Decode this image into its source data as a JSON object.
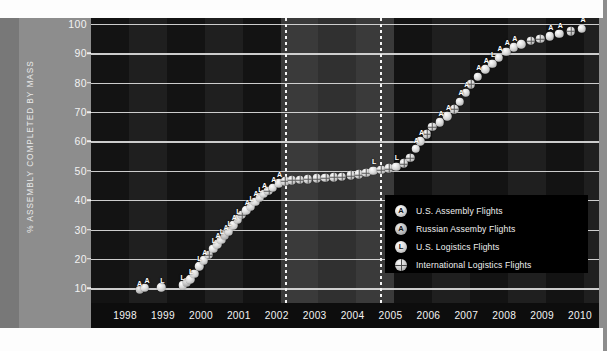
{
  "chart_data": {
    "type": "scatter",
    "title": "",
    "xlabel": "",
    "ylabel": "% ASSEMBLY COMPLETED BY MASS",
    "xlim": [
      1997.6,
      2011.0
    ],
    "ylim": [
      5,
      102
    ],
    "grid": true,
    "legend_position": "inside-right",
    "x_tick_labels": [
      "1998",
      "1999",
      "2000",
      "2001",
      "2002",
      "2003",
      "2004",
      "2005",
      "2006",
      "2007",
      "2008",
      "2009",
      "2010"
    ],
    "y_tick_labels": [
      "10",
      "20",
      "30",
      "40",
      "50",
      "60",
      "70",
      "80",
      "90",
      "100"
    ],
    "y_tick_values": [
      10,
      20,
      30,
      40,
      50,
      60,
      70,
      80,
      90,
      100
    ],
    "annotations": [
      {
        "name": "shuttle-standdown-start",
        "x": 2002.72
      },
      {
        "name": "shuttle-standdown-end",
        "x": 2005.22
      }
    ],
    "legend": [
      {
        "key": "us-assembly",
        "glyph": "A",
        "label": "U.S. Assembly Flights"
      },
      {
        "key": "russian-assembly",
        "glyph": "A",
        "label": "Russian Assemby Flights"
      },
      {
        "key": "us-logistics",
        "glyph": "L",
        "label": "U.S. Logistics Flights"
      },
      {
        "key": "international-logistics",
        "glyph": "",
        "label": "International Logistics Flights"
      }
    ],
    "points": [
      {
        "x": 1998.88,
        "y": 9.5,
        "t": "russian-assembly",
        "flag": "A"
      },
      {
        "x": 1999.02,
        "y": 10.2,
        "t": "us-assembly",
        "flag": "A"
      },
      {
        "x": 1999.45,
        "y": 10.4,
        "t": "us-logistics",
        "flag": "L"
      },
      {
        "x": 2000.02,
        "y": 11.0,
        "t": "us-logistics",
        "flag": "L"
      },
      {
        "x": 2000.12,
        "y": 12.0,
        "t": "russian-assembly",
        "flag": "A"
      },
      {
        "x": 2000.22,
        "y": 13.0,
        "t": "us-logistics",
        "flag": "L"
      },
      {
        "x": 2000.33,
        "y": 15.0,
        "t": "us-assembly",
        "flag": "A"
      },
      {
        "x": 2000.45,
        "y": 17.5,
        "t": "us-logistics",
        "flag": "L"
      },
      {
        "x": 2000.58,
        "y": 19.5,
        "t": "us-assembly",
        "flag": "A"
      },
      {
        "x": 2000.7,
        "y": 21.5,
        "t": "international-logistics",
        "flag": ""
      },
      {
        "x": 2000.82,
        "y": 23.5,
        "t": "us-logistics",
        "flag": "L"
      },
      {
        "x": 2000.93,
        "y": 25.0,
        "t": "us-assembly",
        "flag": "A"
      },
      {
        "x": 2001.03,
        "y": 26.5,
        "t": "us-logistics",
        "flag": "L"
      },
      {
        "x": 2001.13,
        "y": 28.0,
        "t": "russian-assembly",
        "flag": "A"
      },
      {
        "x": 2001.24,
        "y": 29.5,
        "t": "us-logistics",
        "flag": "L"
      },
      {
        "x": 2001.35,
        "y": 31.5,
        "t": "us-assembly",
        "flag": "A"
      },
      {
        "x": 2001.47,
        "y": 33.5,
        "t": "us-logistics",
        "flag": "L"
      },
      {
        "x": 2001.58,
        "y": 35.0,
        "t": "international-logistics",
        "flag": ""
      },
      {
        "x": 2001.7,
        "y": 36.5,
        "t": "us-assembly",
        "flag": "A"
      },
      {
        "x": 2001.82,
        "y": 38.0,
        "t": "us-logistics",
        "flag": "L"
      },
      {
        "x": 2001.93,
        "y": 39.5,
        "t": "us-assembly",
        "flag": "A"
      },
      {
        "x": 2002.05,
        "y": 41.0,
        "t": "us-logistics",
        "flag": "L"
      },
      {
        "x": 2002.16,
        "y": 42.2,
        "t": "us-assembly",
        "flag": "A"
      },
      {
        "x": 2002.28,
        "y": 43.2,
        "t": "international-logistics",
        "flag": ""
      },
      {
        "x": 2002.4,
        "y": 44.2,
        "t": "us-assembly",
        "flag": "A"
      },
      {
        "x": 2002.55,
        "y": 45.8,
        "t": "us-assembly",
        "flag": "A"
      },
      {
        "x": 2002.72,
        "y": 46.5,
        "t": "international-logistics",
        "flag": ""
      },
      {
        "x": 2002.9,
        "y": 46.8,
        "t": "international-logistics",
        "flag": ""
      },
      {
        "x": 2003.1,
        "y": 47.0,
        "t": "international-logistics",
        "flag": ""
      },
      {
        "x": 2003.32,
        "y": 47.2,
        "t": "international-logistics",
        "flag": ""
      },
      {
        "x": 2003.55,
        "y": 47.4,
        "t": "international-logistics",
        "flag": ""
      },
      {
        "x": 2003.78,
        "y": 47.6,
        "t": "international-logistics",
        "flag": ""
      },
      {
        "x": 2004.0,
        "y": 47.8,
        "t": "international-logistics",
        "flag": ""
      },
      {
        "x": 2004.22,
        "y": 48.0,
        "t": "international-logistics",
        "flag": ""
      },
      {
        "x": 2004.45,
        "y": 48.4,
        "t": "international-logistics",
        "flag": ""
      },
      {
        "x": 2004.66,
        "y": 48.8,
        "t": "international-logistics",
        "flag": ""
      },
      {
        "x": 2004.86,
        "y": 49.4,
        "t": "international-logistics",
        "flag": ""
      },
      {
        "x": 2005.05,
        "y": 50.0,
        "t": "us-logistics",
        "flag": "L"
      },
      {
        "x": 2005.25,
        "y": 50.4,
        "t": "international-logistics",
        "flag": ""
      },
      {
        "x": 2005.45,
        "y": 50.8,
        "t": "international-logistics",
        "flag": ""
      },
      {
        "x": 2005.65,
        "y": 51.4,
        "t": "us-logistics",
        "flag": "L"
      },
      {
        "x": 2005.85,
        "y": 52.5,
        "t": "international-logistics",
        "flag": ""
      },
      {
        "x": 2006.02,
        "y": 54.5,
        "t": "international-logistics",
        "flag": ""
      },
      {
        "x": 2006.16,
        "y": 57.5,
        "t": "us-assembly",
        "flag": "A"
      },
      {
        "x": 2006.28,
        "y": 60.0,
        "t": "us-assembly",
        "flag": "A"
      },
      {
        "x": 2006.45,
        "y": 62.5,
        "t": "international-logistics",
        "flag": ""
      },
      {
        "x": 2006.6,
        "y": 65.0,
        "t": "international-logistics",
        "flag": ""
      },
      {
        "x": 2006.8,
        "y": 66.5,
        "t": "us-assembly",
        "flag": "A"
      },
      {
        "x": 2007.0,
        "y": 68.5,
        "t": "us-assembly",
        "flag": "A"
      },
      {
        "x": 2007.18,
        "y": 71.0,
        "t": "international-logistics",
        "flag": ""
      },
      {
        "x": 2007.33,
        "y": 73.5,
        "t": "us-assembly",
        "flag": "A"
      },
      {
        "x": 2007.48,
        "y": 76.5,
        "t": "us-assembly",
        "flag": "A"
      },
      {
        "x": 2007.62,
        "y": 79.5,
        "t": "international-logistics",
        "flag": ""
      },
      {
        "x": 2007.8,
        "y": 82.0,
        "t": "us-assembly",
        "flag": "A"
      },
      {
        "x": 2008.0,
        "y": 84.5,
        "t": "us-assembly",
        "flag": "A"
      },
      {
        "x": 2008.18,
        "y": 86.5,
        "t": "us-logistics",
        "flag": "L"
      },
      {
        "x": 2008.36,
        "y": 88.5,
        "t": "us-assembly",
        "flag": "A"
      },
      {
        "x": 2008.55,
        "y": 90.5,
        "t": "us-assembly",
        "flag": "A"
      },
      {
        "x": 2008.75,
        "y": 92.0,
        "t": "us-assembly",
        "flag": "A"
      },
      {
        "x": 2008.95,
        "y": 93.0,
        "t": "us-logistics",
        "flag": "L"
      },
      {
        "x": 2009.2,
        "y": 94.2,
        "t": "international-logistics",
        "flag": ""
      },
      {
        "x": 2009.45,
        "y": 95.0,
        "t": "international-logistics",
        "flag": ""
      },
      {
        "x": 2009.7,
        "y": 95.8,
        "t": "us-assembly",
        "flag": "A"
      },
      {
        "x": 2009.95,
        "y": 96.6,
        "t": "us-assembly",
        "flag": "A"
      },
      {
        "x": 2010.25,
        "y": 97.5,
        "t": "international-logistics",
        "flag": ""
      },
      {
        "x": 2010.55,
        "y": 98.4,
        "t": "us-assembly",
        "flag": "A"
      }
    ],
    "flag_labels": [
      {
        "x": 1998.88,
        "y": 9.5,
        "text": "A"
      },
      {
        "x": 1999.08,
        "y": 10.4,
        "text": "A"
      },
      {
        "x": 1999.48,
        "y": 10.6,
        "text": "L"
      },
      {
        "x": 2000.02,
        "y": 11.4,
        "text": "L"
      },
      {
        "x": 2000.24,
        "y": 13.4,
        "text": "L"
      },
      {
        "x": 2000.46,
        "y": 18.0,
        "text": "L"
      },
      {
        "x": 2000.6,
        "y": 20.0,
        "text": "A"
      },
      {
        "x": 2000.84,
        "y": 24.0,
        "text": "L"
      },
      {
        "x": 2000.95,
        "y": 25.6,
        "text": "A"
      },
      {
        "x": 2001.05,
        "y": 27.0,
        "text": "L"
      },
      {
        "x": 2001.16,
        "y": 28.6,
        "text": "A"
      },
      {
        "x": 2001.26,
        "y": 30.0,
        "text": "L"
      },
      {
        "x": 2001.38,
        "y": 32.0,
        "text": "A"
      },
      {
        "x": 2001.49,
        "y": 34.0,
        "text": "L"
      },
      {
        "x": 2001.72,
        "y": 37.0,
        "text": "A"
      },
      {
        "x": 2001.84,
        "y": 38.5,
        "text": "L"
      },
      {
        "x": 2001.95,
        "y": 40.0,
        "text": "A"
      },
      {
        "x": 2002.07,
        "y": 41.5,
        "text": "L"
      },
      {
        "x": 2002.18,
        "y": 42.8,
        "text": "A"
      },
      {
        "x": 2002.42,
        "y": 44.8,
        "text": "A"
      },
      {
        "x": 2002.57,
        "y": 46.4,
        "text": "A"
      },
      {
        "x": 2005.07,
        "y": 50.8,
        "text": "L"
      },
      {
        "x": 2005.67,
        "y": 52.2,
        "text": "L"
      },
      {
        "x": 2006.18,
        "y": 58.2,
        "text": "A"
      },
      {
        "x": 2006.32,
        "y": 60.8,
        "text": "A"
      },
      {
        "x": 2006.83,
        "y": 67.3,
        "text": "A"
      },
      {
        "x": 2007.03,
        "y": 69.3,
        "text": "A"
      },
      {
        "x": 2007.36,
        "y": 74.3,
        "text": "A"
      },
      {
        "x": 2007.51,
        "y": 77.3,
        "text": "A"
      },
      {
        "x": 2007.83,
        "y": 82.8,
        "text": "A"
      },
      {
        "x": 2008.03,
        "y": 85.3,
        "text": "A"
      },
      {
        "x": 2008.21,
        "y": 87.3,
        "text": "L"
      },
      {
        "x": 2008.39,
        "y": 89.3,
        "text": "A"
      },
      {
        "x": 2008.58,
        "y": 91.3,
        "text": "A"
      },
      {
        "x": 2008.78,
        "y": 92.8,
        "text": "A"
      },
      {
        "x": 2009.73,
        "y": 96.6,
        "text": "A"
      },
      {
        "x": 2009.98,
        "y": 97.4,
        "text": "A"
      },
      {
        "x": 2010.58,
        "y": 99.2,
        "text": "A"
      }
    ]
  },
  "colors": {
    "plot_background": "#151515",
    "poster_background": "#8d8d8d",
    "gridline": "#dcdcdc",
    "marker": "#dcdcdc",
    "axis_text": "#f2f2f2",
    "legend_background": "#000000"
  }
}
